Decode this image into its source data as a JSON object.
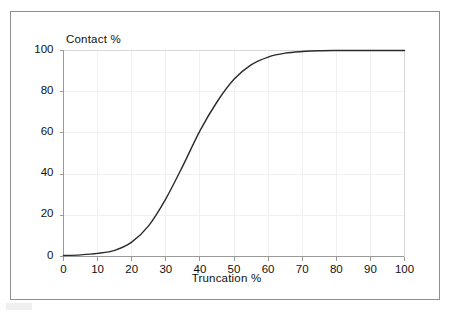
{
  "figure": {
    "background_color": "#ffffff",
    "frame_color": "#8e8e8e",
    "plot_line_color": "#2b2b2b",
    "grid_color": "#f0f0f0",
    "axis_color": "#9a9a9a"
  },
  "chart_data": {
    "type": "line",
    "title": "",
    "xlabel": "Truncation %",
    "ylabel": "Contact %",
    "xlim": [
      0,
      100
    ],
    "ylim": [
      0,
      100
    ],
    "xticks": [
      "0",
      "10",
      "20",
      "30",
      "40",
      "50",
      "60",
      "70",
      "80",
      "90",
      "100"
    ],
    "yticks": [
      "0",
      "20",
      "40",
      "60",
      "80",
      "100"
    ],
    "grid": true,
    "legend": false,
    "legend_position": "none",
    "series": [
      {
        "name": "Contact %",
        "x": [
          0,
          5,
          10,
          15,
          20,
          25,
          30,
          35,
          40,
          45,
          50,
          55,
          60,
          65,
          70,
          75,
          80,
          85,
          90,
          95,
          100
        ],
        "values": [
          0.5,
          0.8,
          1.5,
          3,
          7,
          15,
          28,
          44,
          61,
          75,
          86,
          93,
          96.8,
          98.7,
          99.5,
          99.9,
          100,
          100,
          100,
          100,
          100
        ]
      }
    ],
    "annotations": []
  }
}
